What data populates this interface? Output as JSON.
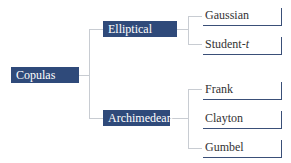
{
  "root": {
    "label": "Copulas"
  },
  "branches": [
    {
      "label": "Elliptical",
      "leaves": [
        {
          "label": "Gaussian"
        },
        {
          "label": "Student-",
          "italic": "t"
        }
      ]
    },
    {
      "label": "Archimedean",
      "leaves": [
        {
          "label": "Frank"
        },
        {
          "label": "Clayton"
        },
        {
          "label": "Gumbel"
        }
      ]
    }
  ],
  "colors": {
    "node_fill": "#2f4a7a",
    "connector": "#c8ccd2",
    "leaf_border": "#3a4f78"
  }
}
